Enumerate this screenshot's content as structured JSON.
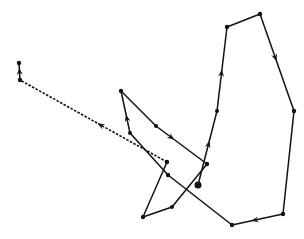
{
  "diagram": {
    "type": "movement-path",
    "stroke_color": "#111111",
    "background": "#ffffff",
    "nodes": [
      {
        "id": "start",
        "x": 198,
        "y": 185,
        "r": 3.5
      },
      {
        "id": "n1",
        "x": 217,
        "y": 111,
        "r": 2
      },
      {
        "id": "n2",
        "x": 227,
        "y": 27,
        "r": 2.2
      },
      {
        "id": "n3",
        "x": 260,
        "y": 14,
        "r": 2.2
      },
      {
        "id": "n4",
        "x": 294,
        "y": 111,
        "r": 2.2
      },
      {
        "id": "n5",
        "x": 283,
        "y": 214,
        "r": 2.2
      },
      {
        "id": "n6",
        "x": 232,
        "y": 225,
        "r": 2.2
      },
      {
        "id": "n7",
        "x": 168,
        "y": 175,
        "r": 2.2
      },
      {
        "id": "n8",
        "x": 130,
        "y": 133,
        "r": 2
      },
      {
        "id": "n9",
        "x": 121,
        "y": 91,
        "r": 2.2
      },
      {
        "id": "n10",
        "x": 156,
        "y": 126,
        "r": 2
      },
      {
        "id": "n11",
        "x": 207,
        "y": 164,
        "r": 2.2
      },
      {
        "id": "n12",
        "x": 172,
        "y": 207,
        "r": 2
      },
      {
        "id": "n13",
        "x": 143,
        "y": 217,
        "r": 2.2
      },
      {
        "id": "n14",
        "x": 167,
        "y": 162,
        "r": 2.2
      },
      {
        "id": "n15",
        "x": 20,
        "y": 80,
        "r": 2.2
      },
      {
        "id": "end",
        "x": 19,
        "y": 63,
        "r": 2.2
      }
    ],
    "segments": [
      {
        "from": "start",
        "to": "n1",
        "style": "solid",
        "arrow_at": 0.55
      },
      {
        "from": "n1",
        "to": "n2",
        "style": "solid",
        "arrow_at": 0.45
      },
      {
        "from": "n2",
        "to": "n3",
        "style": "solid"
      },
      {
        "from": "n3",
        "to": "n4",
        "style": "solid",
        "arrow_at": 0.45
      },
      {
        "from": "n4",
        "to": "n5",
        "style": "solid"
      },
      {
        "from": "n5",
        "to": "n6",
        "style": "solid",
        "arrow_at": 0.55
      },
      {
        "from": "n6",
        "to": "n7",
        "style": "solid"
      },
      {
        "from": "n7",
        "to": "n8",
        "style": "solid"
      },
      {
        "from": "n8",
        "to": "n9",
        "style": "solid",
        "arrow_at": 0.35
      },
      {
        "from": "n9",
        "to": "n10",
        "style": "solid"
      },
      {
        "from": "n10",
        "to": "n11",
        "style": "solid",
        "arrow_at": 0.3
      },
      {
        "from": "n11",
        "to": "n12",
        "style": "solid"
      },
      {
        "from": "n12",
        "to": "n13",
        "style": "solid"
      },
      {
        "from": "n13",
        "to": "n14",
        "style": "solid"
      },
      {
        "from": "n14",
        "to": "n15",
        "style": "dashed",
        "arrow_at": 0.45
      },
      {
        "from": "n15",
        "to": "end",
        "style": "solid",
        "arrow_at": 0.5
      }
    ]
  }
}
